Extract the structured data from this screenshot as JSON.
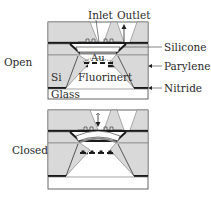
{
  "diagram": {
    "states": [
      {
        "id": "open",
        "label": "Open"
      },
      {
        "id": "closed",
        "label": "Closed"
      }
    ],
    "port_labels": {
      "inlet": "Inlet",
      "outlet": "Outlet"
    },
    "inner_labels": {
      "au": "Au",
      "fluorinert": "Fluorinert",
      "si": "Si",
      "glass": "Glass"
    },
    "callouts": [
      {
        "id": "silicone",
        "label": "Silicone"
      },
      {
        "id": "parylene",
        "label": "Parylene"
      },
      {
        "id": "nitride",
        "label": "Nitride"
      }
    ],
    "colors": {
      "silicon_fill": "#d9d9d9",
      "layer_dark": "#1a1a1a",
      "outline": "#555555",
      "background": "#ffffff"
    }
  }
}
